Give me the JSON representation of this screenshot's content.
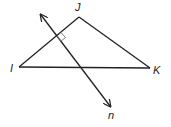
{
  "diagram": {
    "type": "geometry",
    "triangle": {
      "vertices": [
        {
          "name": "I",
          "x": 19,
          "y": 67
        },
        {
          "name": "J",
          "x": 79,
          "y": 17
        },
        {
          "name": "K",
          "x": 150,
          "y": 68
        }
      ]
    },
    "line": {
      "name": "n",
      "start": {
        "x": 41,
        "y": 15
      },
      "end": {
        "x": 110,
        "y": 106
      },
      "arrows": "both"
    },
    "right_angle_mark": {
      "at_side": "IJ",
      "x": 58,
      "y": 35
    },
    "labels": {
      "I": "I",
      "J": "J",
      "K": "K",
      "n": "n"
    },
    "colors": {
      "stroke": "#222222",
      "mark": "#777777",
      "background": "#ffffff"
    }
  }
}
